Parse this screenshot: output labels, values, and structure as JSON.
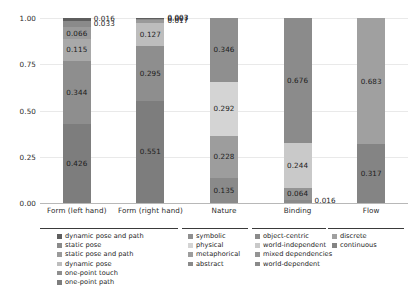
{
  "chart_data": {
    "type": "bar",
    "subtype": "stacked-bar-100",
    "title": "",
    "xlabel": "",
    "ylabel": "",
    "ylim": [
      0,
      1
    ],
    "yticks": [
      "0.00",
      "0.25",
      "0.50",
      "0.75",
      "1.00"
    ],
    "ytick_values": [
      0.0,
      0.25,
      0.5,
      0.75,
      1.0
    ],
    "grid": true,
    "legend_position": "bottom",
    "categories": [
      "Form (left hand)",
      "Form (right hand)",
      "Nature",
      "Binding",
      "Flow"
    ],
    "columns": [
      {
        "category": "Form (left hand)",
        "segments": [
          {
            "label": "one-point path",
            "value": 0.426,
            "value_text": "0.426",
            "color": "#7d7d7d",
            "outside": false
          },
          {
            "label": "one-point touch",
            "value": 0.344,
            "value_text": "0.344",
            "color": "#8e8e8e",
            "outside": false
          },
          {
            "label": "dynamic pose",
            "value": 0.115,
            "value_text": "0.115",
            "color": "#a9a9a9",
            "outside": false
          },
          {
            "label": "static pose and path",
            "value": 0.066,
            "value_text": "0.066",
            "color": "#9a9a9a",
            "outside": false
          },
          {
            "label": "static pose",
            "value": 0.033,
            "value_text": "0.033",
            "color": "#8a8a8a",
            "outside": true
          },
          {
            "label": "dynamic pose and path",
            "value": 0.016,
            "value_text": "0.016",
            "color": "#5e5e5e",
            "outside": true
          }
        ]
      },
      {
        "category": "Form (right hand)",
        "segments": [
          {
            "label": "one-point path",
            "value": 0.551,
            "value_text": "0.551",
            "color": "#7d7d7d",
            "outside": false
          },
          {
            "label": "one-point touch",
            "value": 0.295,
            "value_text": "0.295",
            "color": "#8e8e8e",
            "outside": false
          },
          {
            "label": "dynamic pose",
            "value": 0.127,
            "value_text": "0.127",
            "color": "#bdbdbd",
            "outside": false
          },
          {
            "label": "static pose and path",
            "value": 0.017,
            "value_text": "0.017",
            "color": "#9a9a9a",
            "outside": true
          },
          {
            "label": "static pose",
            "value": 0.007,
            "value_text": "0.007",
            "color": "#8a8a8a",
            "outside": true
          },
          {
            "label": "dynamic pose and path",
            "value": 0.003,
            "value_text": "0.003",
            "color": "#5e5e5e",
            "outside": true
          }
        ]
      },
      {
        "category": "Nature",
        "segments": [
          {
            "label": "abstract",
            "value": 0.135,
            "value_text": "0.135",
            "color": "#8a8a8a",
            "outside": false
          },
          {
            "label": "metaphorical",
            "value": 0.228,
            "value_text": "0.228",
            "color": "#9d9d9d",
            "outside": false
          },
          {
            "label": "physical",
            "value": 0.292,
            "value_text": "0.292",
            "color": "#d4d4d4",
            "outside": false
          },
          {
            "label": "symbolic",
            "value": 0.346,
            "value_text": "0.346",
            "color": "#8f8f8f",
            "outside": false
          }
        ]
      },
      {
        "category": "Binding",
        "segments": [
          {
            "label": "world-dependent",
            "value": 0.016,
            "value_text": "0.016",
            "color": "#8a8a8a",
            "outside": true
          },
          {
            "label": "mixed dependencies",
            "value": 0.064,
            "value_text": "0.064",
            "color": "#949494",
            "outside": false
          },
          {
            "label": "world-independent",
            "value": 0.244,
            "value_text": "0.244",
            "color": "#c9c9c9",
            "outside": false
          },
          {
            "label": "object-centric",
            "value": 0.676,
            "value_text": "0.676",
            "color": "#8b8b8b",
            "outside": false
          }
        ]
      },
      {
        "category": "Flow",
        "segments": [
          {
            "label": "continuous",
            "value": 0.317,
            "value_text": "0.317",
            "color": "#848484",
            "outside": false
          },
          {
            "label": "discrete",
            "value": 0.683,
            "value_text": "0.683",
            "color": "#a0a0a0",
            "outside": false
          }
        ]
      }
    ],
    "legend_groups": [
      {
        "name": "form",
        "items": [
          {
            "label": "dynamic pose and path",
            "color": "#5e5e5e"
          },
          {
            "label": "static pose",
            "color": "#8a8a8a"
          },
          {
            "label": "static pose and path",
            "color": "#9a9a9a"
          },
          {
            "label": "dynamic pose",
            "color": "#bdbdbd"
          },
          {
            "label": "one-point touch",
            "color": "#8e8e8e"
          },
          {
            "label": "one-point path",
            "color": "#7d7d7d"
          }
        ]
      },
      {
        "name": "nature",
        "items": [
          {
            "label": "symbolic",
            "color": "#8f8f8f"
          },
          {
            "label": "physical",
            "color": "#d4d4d4"
          },
          {
            "label": "metaphorical",
            "color": "#9d9d9d"
          },
          {
            "label": "abstract",
            "color": "#8a8a8a"
          }
        ]
      },
      {
        "name": "binding",
        "items": [
          {
            "label": "object-centric",
            "color": "#8b8b8b"
          },
          {
            "label": "world-independent",
            "color": "#c9c9c9"
          },
          {
            "label": "mixed dependencies",
            "color": "#949494"
          },
          {
            "label": "world-dependent",
            "color": "#8a8a8a"
          }
        ]
      },
      {
        "name": "flow",
        "items": [
          {
            "label": "discrete",
            "color": "#a0a0a0"
          },
          {
            "label": "continuous",
            "color": "#848484"
          }
        ]
      }
    ]
  }
}
